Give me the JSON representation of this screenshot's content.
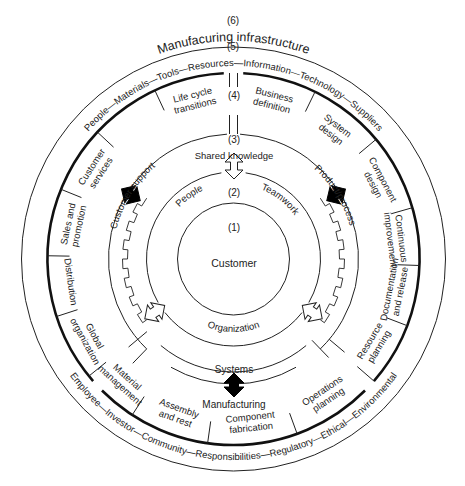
{
  "diagram": {
    "title": "Manufacuring infrastructure",
    "level_labels": {
      "l1": "(1)",
      "l2": "(2)",
      "l3": "(3)",
      "l4": "(4)",
      "l5": "(5)",
      "l6": "(6)"
    },
    "core": "Customer",
    "ring2_labels": [
      "People",
      "Teamwork",
      "Organization"
    ],
    "ring3_labels": {
      "top": "Shared knowledge",
      "bottom": "Systems",
      "left": "Customer support",
      "right": "Product/process",
      "below": "Manufacturing"
    },
    "sector_labels": [
      {
        "id": "life-cycle-transitions",
        "lines": [
          "Life cycle",
          "transitions"
        ]
      },
      {
        "id": "business-definition",
        "lines": [
          "Business",
          "definition"
        ]
      },
      {
        "id": "system-design",
        "lines": [
          "System",
          "design"
        ]
      },
      {
        "id": "component-design",
        "lines": [
          "Component",
          "design"
        ]
      },
      {
        "id": "continuous-improvement",
        "lines": [
          "Continuous",
          "improvement"
        ]
      },
      {
        "id": "documentation-and-release",
        "lines": [
          "Documentation",
          "and release"
        ]
      },
      {
        "id": "resource-planning",
        "lines": [
          "Resource",
          "planning"
        ]
      },
      {
        "id": "operations-planning",
        "lines": [
          "Operations",
          "planning"
        ]
      },
      {
        "id": "component-fabrication",
        "lines": [
          "Component",
          "fabrication"
        ]
      },
      {
        "id": "assembly-and-rest",
        "lines": [
          "Assembly",
          "and rest"
        ]
      },
      {
        "id": "material-management",
        "lines": [
          "Material",
          "management"
        ]
      },
      {
        "id": "global-organization",
        "lines": [
          "Global",
          "organization"
        ]
      },
      {
        "id": "distribution",
        "lines": [
          "Distribution"
        ]
      },
      {
        "id": "sales-and-promotion",
        "lines": [
          "Sales and",
          "promotion"
        ]
      },
      {
        "id": "customer-services",
        "lines": [
          "Customer",
          "services"
        ]
      }
    ],
    "infrastructure_top": "People—Materials—Tools—Resources—Information—Technology—Suppliers",
    "infrastructure_bottom": "Employee—Investor—Community—Responsibilities—Regulatory—Ethical—Environmental"
  }
}
